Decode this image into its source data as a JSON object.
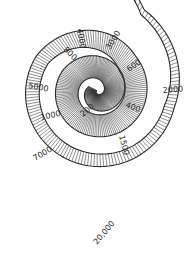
{
  "diagram": {
    "type": "spiral-scale",
    "colors": {
      "background": "#ffffff",
      "ink": "#2a2a2a",
      "hatch": "#333333"
    },
    "spiral": {
      "center": [
        97,
        91
      ],
      "turns": 2.9,
      "start_angle_deg": 210,
      "direction": "counterclockwise",
      "keyframes": [
        {
          "t": 0.0,
          "r_in": 0,
          "r_out": 9
        },
        {
          "t": 0.35,
          "r_in": 3,
          "r_out": 20
        },
        {
          "t": 0.7,
          "r_in": 9,
          "r_out": 31
        },
        {
          "t": 1.0,
          "r_in": 17,
          "r_out": 40
        },
        {
          "t": 1.35,
          "r_in": 24,
          "r_out": 46
        },
        {
          "t": 1.7,
          "r_in": 30,
          "r_out": 52
        },
        {
          "t": 2.0,
          "r_in": 56,
          "r_out": 70
        },
        {
          "t": 2.3,
          "r_in": 62,
          "r_out": 75
        },
        {
          "t": 2.55,
          "r_in": 69,
          "r_out": 79
        },
        {
          "t": 2.75,
          "r_in": 88,
          "r_out": 94
        },
        {
          "t": 2.9,
          "r_in": 160,
          "r_out": 161
        }
      ],
      "hatch_count": 420
    },
    "labels": [
      {
        "text": "200",
        "x": 83,
        "y": 117,
        "rotate": -40
      },
      {
        "text": "400",
        "x": 125,
        "y": 107,
        "rotate": 20
      },
      {
        "text": "600",
        "x": 129,
        "y": 72,
        "rotate": -35
      },
      {
        "text": "800",
        "x": 63,
        "y": 50,
        "rotate": 45
      },
      {
        "text": "1000",
        "x": 41,
        "y": 120,
        "rotate": -12
      },
      {
        "text": "1500",
        "x": 119,
        "y": 136,
        "rotate": 75
      },
      {
        "text": "2000",
        "x": 163,
        "y": 93,
        "rotate": -5
      },
      {
        "text": "3000",
        "x": 110,
        "y": 50,
        "rotate": -58
      },
      {
        "text": "4000",
        "x": 77,
        "y": 29,
        "rotate": 80
      },
      {
        "text": "5000",
        "x": 28,
        "y": 88,
        "rotate": 10
      },
      {
        "text": "7000",
        "x": 35,
        "y": 161,
        "rotate": -30
      },
      {
        "text": "20,000",
        "x": 97,
        "y": 245,
        "rotate": -50
      }
    ]
  }
}
